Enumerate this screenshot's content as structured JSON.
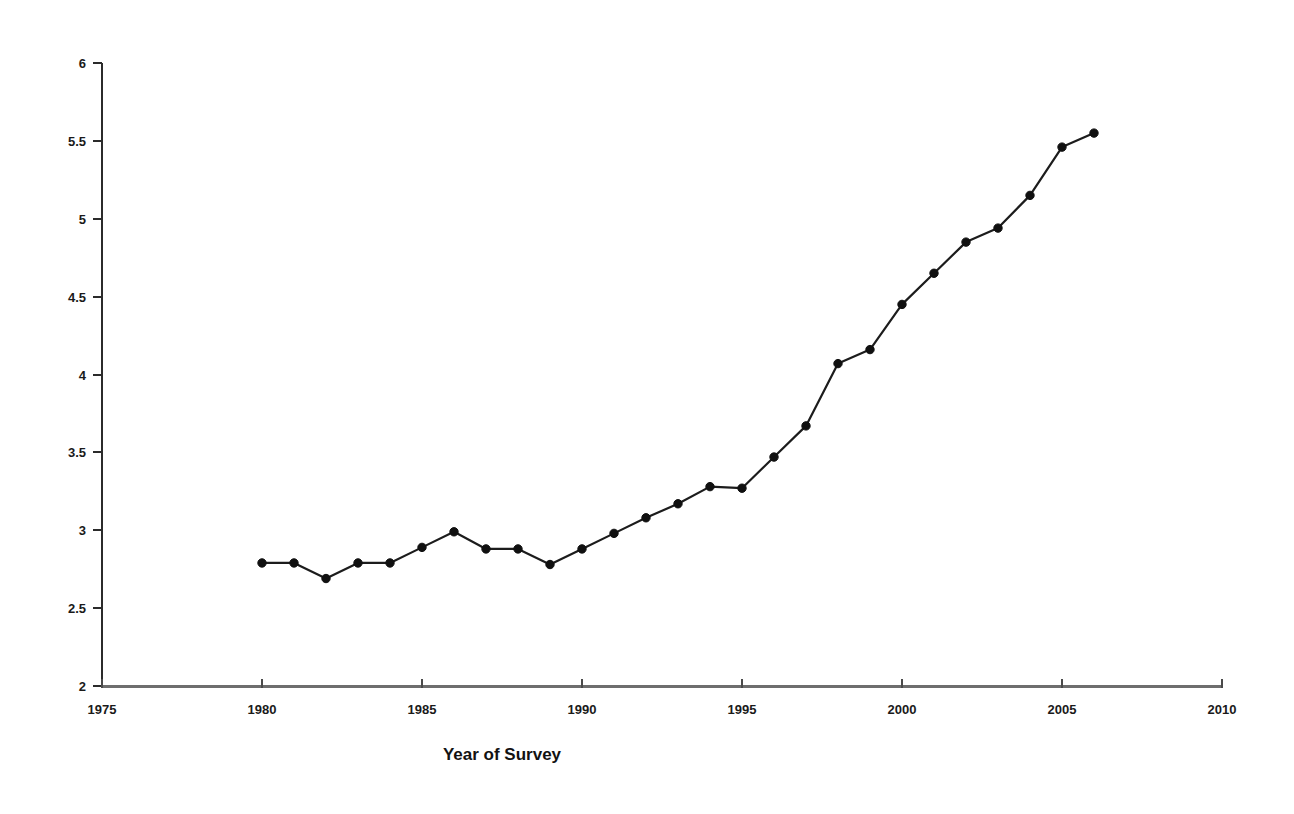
{
  "chart_data": {
    "type": "line",
    "title": "",
    "subtitle": "",
    "xlabel": "Year of Survey",
    "ylabel": "",
    "xlim": [
      1975,
      2010
    ],
    "ylim": [
      2,
      6
    ],
    "grid": false,
    "legend": false,
    "legend_position": "none",
    "x_ticks": [
      1975,
      1980,
      1985,
      1990,
      1995,
      2000,
      2005,
      2010
    ],
    "x_tick_labels": [
      "1975",
      "1980",
      "1985",
      "1990",
      "1995",
      "2000",
      "2005",
      "2010"
    ],
    "y_ticks": [
      2,
      2.5,
      3,
      3.5,
      4,
      4.5,
      5,
      5.5,
      6
    ],
    "y_tick_labels": [
      "2",
      "2.5",
      "3",
      "3.5",
      "4",
      "4.5",
      "5",
      "5.5",
      "6"
    ],
    "series": [
      {
        "name": "Survey value",
        "color": "#101010",
        "marker": "circle",
        "x": [
          1980,
          1981,
          1982,
          1983,
          1984,
          1985,
          1986,
          1987,
          1988,
          1989,
          1990,
          1991,
          1992,
          1993,
          1994,
          1995,
          1996,
          1997,
          1998,
          1999,
          2000,
          2001,
          2002,
          2003,
          2004,
          2005,
          2006
        ],
        "values": [
          2.79,
          2.79,
          2.69,
          2.79,
          2.79,
          2.89,
          2.99,
          2.88,
          2.88,
          2.78,
          2.88,
          2.98,
          3.08,
          3.17,
          3.28,
          3.27,
          3.47,
          3.67,
          4.07,
          4.16,
          4.45,
          4.65,
          4.85,
          4.94,
          5.15,
          5.46,
          5.55
        ]
      }
    ]
  },
  "axis_label": {
    "x_title": "Year of Survey"
  }
}
